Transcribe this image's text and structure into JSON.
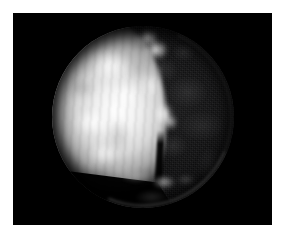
{
  "canvas": {
    "width": 289,
    "height": 237,
    "background_color": "#ffffff"
  },
  "image_panel": {
    "name": "astronomical-frame",
    "x": 13,
    "y": 13,
    "width": 259,
    "height": 212,
    "background_color": "#000000"
  },
  "subject": {
    "type": "planetary-disc",
    "description": "Telescopic image of a spherical body showing a bright sunlit hemisphere on the left and a dark shadowed hemisphere on the right, separated by an irregular terminator.",
    "center_x": 143,
    "center_y": 117,
    "radius": 91,
    "phase": "near-quarter",
    "illuminated_side": "left"
  },
  "features": [
    {
      "name": "sunlit-hemisphere",
      "description": "Bright mottled illuminated face occupying the left portion of the disc",
      "brightness": "high",
      "color": "#ffffff"
    },
    {
      "name": "shadowed-hemisphere",
      "description": "Dark night side with faint noisy surface mottling",
      "brightness": "very-low",
      "color": "#121213"
    },
    {
      "name": "terminator",
      "description": "Irregular jagged boundary between lit and unlit hemispheres running roughly vertically",
      "position_x": 140
    },
    {
      "name": "terminator-bright-lobe",
      "description": "Isolated bright blob protruding into the night side right of the terminator",
      "position_x": 152,
      "position_y": 106
    },
    {
      "name": "dark-streak",
      "description": "Narrow dark vertical lane descending through the lower middle of the disc",
      "position_x": 148,
      "position_y": 150
    },
    {
      "name": "bottom-bright-patches",
      "description": "Faint brighter patches near the bottom centre of the disc",
      "position_x": 150,
      "position_y": 188
    },
    {
      "name": "limb-arc",
      "description": "Thin illuminated limb arc along the lower-right edge of the disc",
      "position_x": 205,
      "position_y": 185
    },
    {
      "name": "lower-left-shadow-cut",
      "description": "Sharp diagonal boundary where the bright region ends on the lower left",
      "position_x": 95,
      "position_y": 178
    }
  ],
  "colors": {
    "frame_background": "#000000",
    "page_background": "#ffffff",
    "highlight": "#ffffff",
    "night_side": "#121213",
    "limb_glow": "#cdcdcd"
  }
}
